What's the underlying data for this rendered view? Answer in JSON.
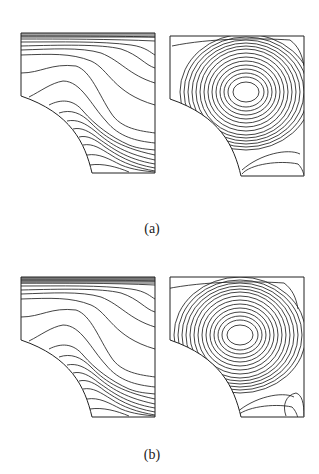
{
  "figure": {
    "rows": [
      {
        "label": "(a)",
        "panels": [
          {
            "id": "a-left",
            "kind": "isotherm-contours",
            "geometry": "square-domain-with-quarter-circle-cutout-bottom-left"
          },
          {
            "id": "a-right",
            "kind": "streamline-contours",
            "geometry": "square-domain-with-quarter-circle-cutout-bottom-left",
            "vortex_center": "upper-middle-right"
          }
        ]
      },
      {
        "label": "(b)",
        "panels": [
          {
            "id": "b-left",
            "kind": "isotherm-contours",
            "geometry": "square-domain-with-quarter-circle-cutout-bottom-left"
          },
          {
            "id": "b-right",
            "kind": "streamline-contours",
            "geometry": "square-domain-with-quarter-circle-cutout-bottom-left",
            "vortex_center": "upper-middle",
            "secondary_cell": "bottom-right-corner"
          }
        ]
      }
    ],
    "line_color": "#222222",
    "background": "#ffffff"
  }
}
